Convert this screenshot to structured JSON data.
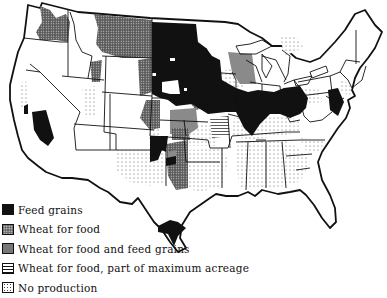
{
  "map": {
    "subject": "United States grain production regions",
    "colors": {
      "feed_grains": "#111111",
      "wheat_for_food": "#666666",
      "wheat_for_food_and_feed_grains": "#8a8a8a",
      "outline": "#111111",
      "background": "#ffffff"
    }
  },
  "legend": {
    "items": [
      {
        "key": "feed_grains",
        "label": "Feed grains",
        "pattern": "solid-black"
      },
      {
        "key": "wheat_for_food",
        "label": "Wheat for food",
        "pattern": "dense-dot-gray"
      },
      {
        "key": "wheat_food_feed",
        "label": "Wheat for food and feed grains",
        "pattern": "medium-gray"
      },
      {
        "key": "wheat_part_max",
        "label": "Wheat for food, part of maximum acreage",
        "pattern": "horizontal-lines"
      },
      {
        "key": "no_production",
        "label": "No production",
        "pattern": "sparse-dots"
      }
    ]
  }
}
